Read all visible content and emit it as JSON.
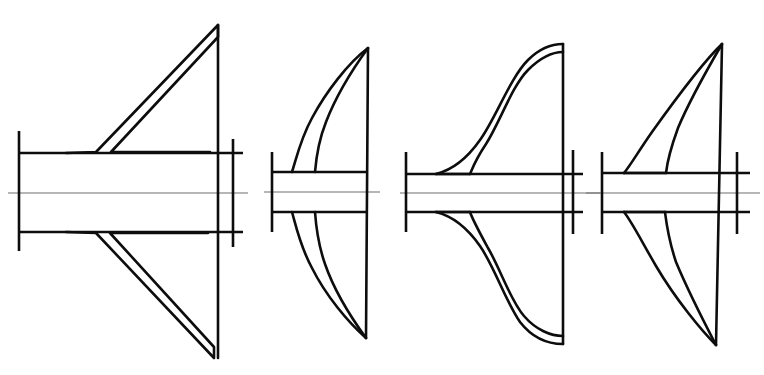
{
  "sheet": {
    "title": "Propeller Blade Section Profiles",
    "background_color": "#ffffff",
    "line_color": "#0d0d0d",
    "axis_color": "#6f6f6f",
    "width": 764,
    "height": 375,
    "figure_count": 4
  },
  "figures": [
    {
      "id": "figure-1",
      "label": "Straight Taper Blade Profile",
      "index": "1",
      "axis": {
        "y": 193,
        "x_start": 8,
        "x_end": 248
      },
      "hub": {
        "top_y": 153,
        "bottom_y": 232,
        "left_x": 19,
        "right_x": 243,
        "flange_left_x": 19,
        "flange_left_top": 131,
        "flange_left_bottom": 251,
        "flange_right_x": 233,
        "flange_right_top": 139,
        "flange_right_bottom": 247
      },
      "blade_upper": "M 19 153 L 66 153 L 96 152 L 218 25 L 218 37 L 111 152 L 218 152",
      "blade_lower": "M 19 232 L 66 232 L 96 233 L 214 358 L 214 347 L 110 233 L 214 233",
      "trailing_edge": "M 218 25 L 218 358"
    },
    {
      "id": "figure-2",
      "label": "Curved Scimitar Blade Profile",
      "index": "2",
      "axis": {
        "y": 192,
        "x_start": 264,
        "x_end": 380
      },
      "hub": {
        "top_y": 172,
        "bottom_y": 212,
        "left_x": 272,
        "right_x": 366,
        "flange_left_x": 272,
        "flange_left_top": 152,
        "flange_left_bottom": 232
      },
      "blade_upper": "M 272 172 L 292 172 C 296 160 300 140 312 118 C 326 92 346 64 368 48 C 352 70 336 96 326 122 C 318 142 316 160 315 172 Z",
      "blade_lower": "M 272 212 L 292 212 C 296 226 300 246 312 268 C 326 296 346 322 366 338 C 350 316 334 290 325 264 C 318 244 316 226 315 212 Z",
      "trailing_edge": "M 368 48 L 366 338"
    },
    {
      "id": "figure-3",
      "label": "S-Curve Swept Blade Profile",
      "index": "3",
      "axis": {
        "y": 193,
        "x_start": 400,
        "x_end": 600
      },
      "hub": {
        "top_y": 174,
        "bottom_y": 212,
        "left_x": 406,
        "right_x": 583,
        "flange_left_x": 406,
        "flange_left_top": 152,
        "flange_left_bottom": 232,
        "flange_right_x": 573,
        "flange_right_top": 150,
        "flange_right_bottom": 234
      },
      "blade_upper": "M 406 174 L 436 174 C 452 170 466 160 480 140 C 496 118 510 78 528 60 C 540 48 552 44 563 44 L 563 52 C 552 52 540 58 528 70 C 512 86 500 122 486 144 C 474 162 472 170 470 174 Z",
      "blade_lower": "M 406 212 L 436 212 C 452 216 466 226 480 246 C 494 266 506 302 520 322 C 534 340 550 344 563 344 L 563 336 C 550 336 536 330 524 316 C 510 300 500 268 488 248 C 476 226 472 218 470 212 Z",
      "trailing_edge": "M 563 44 L 563 344"
    },
    {
      "id": "figure-4",
      "label": "Narrow Swept Blade Profile",
      "index": "4",
      "axis": {
        "y": 193,
        "x_start": 586,
        "x_end": 760
      },
      "hub": {
        "top_y": 173,
        "bottom_y": 212,
        "left_x": 602,
        "right_x": 750,
        "flange_left_x": 602,
        "flange_left_top": 152,
        "flange_left_bottom": 234,
        "flange_right_x": 737,
        "flange_right_top": 152,
        "flange_right_bottom": 234
      },
      "blade_upper": "M 602 173 L 624 173 C 630 166 638 152 652 132 C 672 104 700 64 722 44 C 706 70 688 104 678 128 C 670 150 667 164 666 173 Z",
      "blade_lower": "M 602 212 L 624 212 C 632 222 642 242 656 266 C 676 300 700 330 715 345 C 700 318 686 286 676 262 C 668 238 666 220 665 212 Z",
      "trailing_edge": "M 722 44 L 716 345"
    }
  ]
}
